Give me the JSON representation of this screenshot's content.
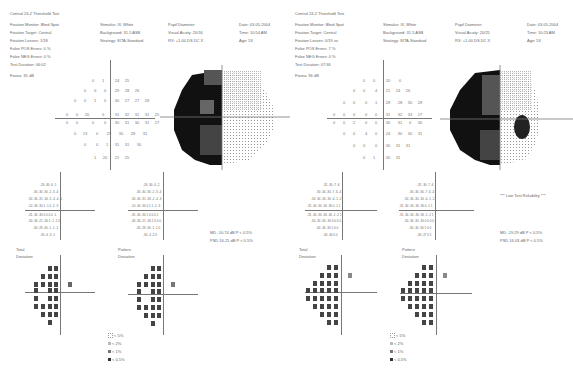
{
  "left": {
    "title": "Central 24-2 Threshold Test",
    "col1": [
      "Fixation Monitor: Blind Spot",
      "Fixation Target: Central",
      "Fixation Losses: 1/18",
      "False POS Errors: 0 %",
      "False NEG Errors: 0 %",
      "Test Duration: 06:02"
    ],
    "fovea": "Fovea: 35 dB",
    "col2": [
      "Stimulus: III, White",
      "Background: 31.5 ASB",
      "Strategy: SITA-Standard"
    ],
    "col3": [
      "Pupil Diameter:",
      "Visual Acuity: 20/16",
      "RX: +1.00 DS    DC X"
    ],
    "col4": [
      "Date: 03-05-2004",
      "Time: 10:54 AM",
      "Age: 53"
    ],
    "thresholds": [
      [
        "",
        "",
        "",
        "",
        "0",
        "1",
        "24",
        "25",
        "",
        ""
      ],
      [
        "",
        "",
        "",
        "0",
        "0",
        "0",
        "29",
        "28",
        "26",
        ""
      ],
      [
        "",
        "",
        "0",
        "0",
        "1",
        "0",
        "30",
        "27",
        "27",
        "28"
      ],
      [
        "",
        "",
        "0",
        "0",
        "20",
        "0",
        "31",
        "32",
        "31",
        "31",
        "25"
      ],
      [
        "",
        "",
        "0",
        "0",
        "0",
        "0",
        "30",
        "31",
        "30",
        "31",
        "27"
      ],
      [
        "",
        "",
        "0",
        "0",
        "13",
        "0",
        "29",
        "30",
        "28",
        "31"
      ],
      [
        "",
        "",
        "",
        "0",
        "0",
        "1",
        "31",
        "31",
        "30",
        ""
      ],
      [
        "",
        "",
        "",
        "",
        "1",
        "20",
        "22",
        "25",
        "",
        ""
      ]
    ],
    "total_label": [
      "Total",
      "Deviation"
    ],
    "pattern_label": [
      "Pattern",
      "Deviation"
    ],
    "md": "MD    -10.74 dB  P < 0.5%",
    "psd": "PSD   16.21 dB  P < 0.5%",
    "legend": [
      "< 5%",
      "< 2%",
      "< 1%",
      "< 0.5%"
    ],
    "axis_marks": [
      "30",
      "30"
    ]
  },
  "right": {
    "title": "Central 24-2 Threshold Test",
    "col1": [
      "Fixation Monitor: Blind Spot",
      "Fixation Target: Central",
      "Fixation Losses: 0/19 xx",
      "False POS Errors: 7 %",
      "False NEG Errors: 0 %",
      "Test Duration: 07:36"
    ],
    "fovea": "Fovea: 36 dB",
    "col2": [
      "Stimulus: III, White",
      "Background: 31.5 ASB",
      "Strategy: SITA-Standard"
    ],
    "col3": [
      "Pupil Diameter:",
      "Visual Acuity: 20/25",
      "RX: +1.00 DS    DC X"
    ],
    "col4": [
      "Date: 03-05-2004",
      "Time: 10:23 AM",
      "Age: 53"
    ],
    "reliability": "*** Low Test Reliability ***",
    "total_label": [
      "Total",
      "Deviation"
    ],
    "pattern_label": [
      "Pattern",
      "Deviation"
    ],
    "md": "MD    -19.29 dB  P < 0.5%",
    "psd": "PSD   16.03 dB  P < 0.5%",
    "legend": [
      "< 5%",
      "< 2%",
      "< 1%",
      "< 0.5%"
    ],
    "axis_marks": [
      "30",
      "30"
    ]
  }
}
